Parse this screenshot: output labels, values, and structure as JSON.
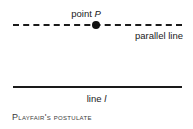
{
  "figure": {
    "caption": "Playfair's postulate",
    "background_color": "#ffffff",
    "ink_color": "#1a1a1a",
    "labels": {
      "point_label_prefix": "point ",
      "point_label_symbol": "P",
      "parallel_line_label": "parallel line",
      "line_label_prefix": "line ",
      "line_label_symbol": "l"
    },
    "elements": {
      "dashed_line_name": "parallel line through point P",
      "solid_line_name": "line l",
      "point_marker_name": "point P"
    }
  }
}
